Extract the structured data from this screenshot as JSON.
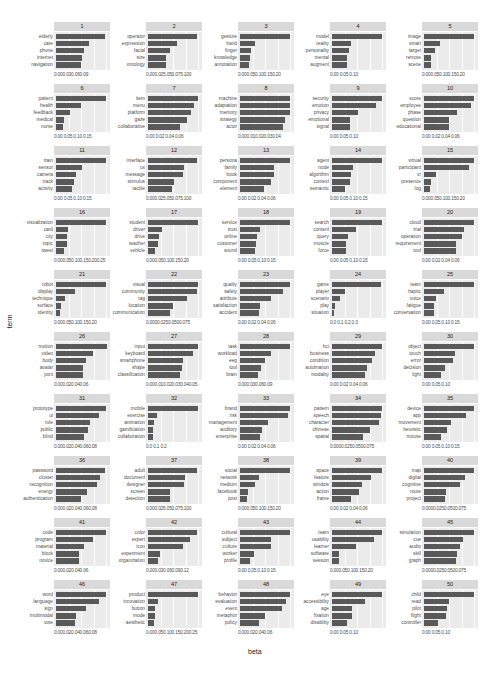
{
  "chart_data": {
    "type": "bar",
    "layout": "facet_wrap 10 rows x 5 cols, horizontal bars",
    "xlabel": "beta",
    "ylabel": "term",
    "grid": true,
    "facets": [
      {
        "topic": "1",
        "terms": [
          "elderly",
          "care",
          "phone",
          "internet",
          "navigation"
        ],
        "values": [
          0.09,
          0.06,
          0.052,
          0.048,
          0.045
        ],
        "ticks": "0.000.030.060.09",
        "xmax": 0.095
      },
      {
        "topic": "2",
        "terms": [
          "operator",
          "expression",
          "facial",
          "size",
          "ontology"
        ],
        "values": [
          0.098,
          0.058,
          0.045,
          0.037,
          0.036
        ],
        "ticks": "0.000.025.050.075.100",
        "xmax": 0.105
      },
      {
        "topic": "3",
        "terms": [
          "gesture",
          "hand",
          "finger",
          "knowledge",
          "annotation"
        ],
        "values": [
          0.2,
          0.06,
          0.045,
          0.042,
          0.035
        ],
        "ticks": "0.000.050.100.150.20",
        "xmax": 0.21
      },
      {
        "topic": "4",
        "terms": [
          "model",
          "reality",
          "personality",
          "mental",
          "augment"
        ],
        "values": [
          0.12,
          0.045,
          0.04,
          0.035,
          0.035
        ],
        "ticks": "0.00  0.05  0.10",
        "xmax": 0.125
      },
      {
        "topic": "5",
        "terms": [
          "image",
          "smart",
          "target",
          "remote",
          "scene"
        ],
        "values": [
          0.2,
          0.065,
          0.045,
          0.03,
          0.03
        ],
        "ticks": "0.000.050.100.150.20",
        "xmax": 0.21
      },
      {
        "topic": "6",
        "terms": [
          "patient",
          "health",
          "feedback",
          "medical",
          "nurse"
        ],
        "values": [
          0.16,
          0.08,
          0.045,
          0.025,
          0.022
        ],
        "ticks": "0.00 0.05 0.10 0.15",
        "xmax": 0.165
      },
      {
        "topic": "7",
        "terms": [
          "item",
          "menu",
          "platform",
          "gaze",
          "collaborative"
        ],
        "values": [
          0.063,
          0.058,
          0.055,
          0.05,
          0.04
        ],
        "ticks": "0.00 0.02 0.04 0.06",
        "xmax": 0.066
      },
      {
        "topic": "8",
        "terms": [
          "machine",
          "adaptation",
          "memory",
          "strategy",
          "actor"
        ],
        "values": [
          0.042,
          0.042,
          0.042,
          0.038,
          0.036
        ],
        "ticks": "0.000.010.020.030.04",
        "xmax": 0.044
      },
      {
        "topic": "9",
        "terms": [
          "security",
          "emotion",
          "privacy",
          "emotional",
          "signal"
        ],
        "values": [
          0.125,
          0.11,
          0.065,
          0.045,
          0.045
        ],
        "ticks": "0.00  0.05  0.10",
        "xmax": 0.13
      },
      {
        "topic": "10",
        "terms": [
          "score",
          "employee",
          "phase",
          "question",
          "educational"
        ],
        "values": [
          0.06,
          0.057,
          0.04,
          0.03,
          0.03
        ],
        "ticks": "0.00 0.02 0.04 0.06",
        "xmax": 0.063
      },
      {
        "topic": "11",
        "terms": [
          "train",
          "sensor",
          "camera",
          "track",
          "activity"
        ],
        "values": [
          0.155,
          0.08,
          0.062,
          0.055,
          0.05
        ],
        "ticks": "0.00 0.05 0.10 0.15",
        "xmax": 0.16
      },
      {
        "topic": "12",
        "terms": [
          "interface",
          "ux",
          "message",
          "stimulus",
          "tactile"
        ],
        "values": [
          0.098,
          0.072,
          0.07,
          0.052,
          0.048
        ],
        "ticks": "0.000.025.050.075.100",
        "xmax": 0.105
      },
      {
        "topic": "13",
        "terms": [
          "persona",
          "family",
          "book",
          "component",
          "element"
        ],
        "values": [
          0.065,
          0.045,
          0.044,
          0.04,
          0.032
        ],
        "ticks": "0.00 0.02 0.04 0.06",
        "xmax": 0.068
      },
      {
        "topic": "14",
        "terms": [
          "agent",
          "node",
          "algorithm",
          "context",
          "semantic"
        ],
        "values": [
          0.145,
          0.06,
          0.055,
          0.052,
          0.038
        ],
        "ticks": "0.00 0.05 0.10 0.15",
        "xmax": 0.15
      },
      {
        "topic": "15",
        "terms": [
          "virtual",
          "participant",
          "vr",
          "presence",
          "log"
        ],
        "values": [
          0.2,
          0.18,
          0.05,
          0.03,
          0.025
        ],
        "ticks": "0.000.050.100.150.20",
        "xmax": 0.21
      },
      {
        "topic": "16",
        "terms": [
          "visualization",
          "card",
          "city",
          "topic",
          "tweet"
        ],
        "values": [
          0.25,
          0.06,
          0.055,
          0.055,
          0.04
        ],
        "ticks": "0.000.050.100.150.200.25",
        "xmax": 0.26
      },
      {
        "topic": "17",
        "terms": [
          "student",
          "driver",
          "drive",
          "teacher",
          "vehicle"
        ],
        "values": [
          0.2,
          0.055,
          0.045,
          0.04,
          0.03
        ],
        "ticks": "0.000.050.100.150.20",
        "xmax": 0.21
      },
      {
        "topic": "18",
        "terms": [
          "service",
          "trust",
          "online",
          "customer",
          "sound"
        ],
        "values": [
          0.16,
          0.065,
          0.055,
          0.05,
          0.048
        ],
        "ticks": "0.00 0.05 0.10 0.15",
        "xmax": 0.165
      },
      {
        "topic": "19",
        "terms": [
          "search",
          "content",
          "query",
          "muscle",
          "force"
        ],
        "values": [
          0.145,
          0.07,
          0.045,
          0.04,
          0.04
        ],
        "ticks": "0.00 0.05 0.10 0.15",
        "xmax": 0.15
      },
      {
        "topic": "20",
        "terms": [
          "cloud",
          "trial",
          "operation",
          "requirement",
          "tool"
        ],
        "values": [
          0.062,
          0.05,
          0.048,
          0.04,
          0.04
        ],
        "ticks": "0.00 0.02 0.04 0.06",
        "xmax": 0.065
      },
      {
        "topic": "21",
        "terms": [
          "robot",
          "display",
          "technique",
          "surface",
          "identity"
        ],
        "values": [
          0.2,
          0.075,
          0.035,
          0.02,
          0.015
        ],
        "ticks": "0.000.050.100.150.20",
        "xmax": 0.21
      },
      {
        "topic": "22",
        "terms": [
          "visual",
          "community",
          "tag",
          "location",
          "communication"
        ],
        "values": [
          0.08,
          0.078,
          0.063,
          0.04,
          0.035
        ],
        "ticks": "0.0000.0250.0500.075",
        "xmax": 0.083
      },
      {
        "topic": "23",
        "terms": [
          "quality",
          "safety",
          "attribute",
          "satisfaction",
          "accident"
        ],
        "values": [
          0.06,
          0.052,
          0.037,
          0.024,
          0.023
        ],
        "ticks": "0.00 0.02 0.04 0.06",
        "xmax": 0.063
      },
      {
        "topic": "24",
        "terms": [
          "game",
          "player",
          "scenario",
          "play",
          "situation"
        ],
        "values": [
          0.35,
          0.09,
          0.055,
          0.02,
          0.015
        ],
        "ticks": "0.0  0.1  0.2  0.3",
        "xmax": 0.37
      },
      {
        "topic": "25",
        "terms": [
          "team",
          "haptic",
          "voice",
          "fatigue",
          "conversation"
        ],
        "values": [
          0.15,
          0.06,
          0.035,
          0.03,
          0.03
        ],
        "ticks": "0.00 0.05 0.10 0.15",
        "xmax": 0.155
      },
      {
        "topic": "26",
        "terms": [
          "motion",
          "video",
          "body",
          "avatar",
          "joint"
        ],
        "values": [
          0.068,
          0.05,
          0.04,
          0.037,
          0.036
        ],
        "ticks": "0.000.020.040.06",
        "xmax": 0.07
      },
      {
        "topic": "27",
        "terms": [
          "input",
          "keyboard",
          "smartphone",
          "shape",
          "classification"
        ],
        "values": [
          0.06,
          0.055,
          0.042,
          0.041,
          0.039
        ],
        "ticks": "0.000.010.020.030.040.05",
        "xmax": 0.063
      },
      {
        "topic": "28",
        "terms": [
          "task",
          "workload",
          "eeg",
          "tool",
          "brain"
        ],
        "values": [
          0.098,
          0.06,
          0.05,
          0.042,
          0.035
        ],
        "ticks": "0.000.030.060.09",
        "xmax": 0.102
      },
      {
        "topic": "29",
        "terms": [
          "hci",
          "business",
          "condition",
          "automation",
          "modality"
        ],
        "values": [
          0.06,
          0.052,
          0.049,
          0.043,
          0.04
        ],
        "ticks": "0.00 0.02 0.04 0.06",
        "xmax": 0.063
      },
      {
        "topic": "30",
        "terms": [
          "object",
          "touch",
          "error",
          "decision",
          "light"
        ],
        "values": [
          0.13,
          0.08,
          0.075,
          0.055,
          0.045
        ],
        "ticks": "0.00  0.05  0.10",
        "xmax": 0.135
      },
      {
        "topic": "31",
        "terms": [
          "prototype",
          "ui",
          "rule",
          "public",
          "blind"
        ],
        "values": [
          0.08,
          0.068,
          0.055,
          0.051,
          0.044
        ],
        "ticks": "0.000.020.040.060.08",
        "xmax": 0.083
      },
      {
        "topic": "32",
        "terms": [
          "mobile",
          "exercise",
          "animation",
          "gamification",
          "collaboration"
        ],
        "values": [
          0.27,
          0.05,
          0.03,
          0.028,
          0.025
        ],
        "ticks": "0.0  0.1  0.2",
        "xmax": 0.28
      },
      {
        "topic": "33",
        "terms": [
          "brand",
          "risk",
          "management",
          "auditory",
          "enterprise"
        ],
        "values": [
          0.08,
          0.076,
          0.045,
          0.035,
          0.032
        ],
        "ticks": "0.00 0.02 0.04 0.06",
        "xmax": 0.083
      },
      {
        "topic": "34",
        "terms": [
          "pattern",
          "speech",
          "character",
          "chinese",
          "spatial"
        ],
        "values": [
          0.08,
          0.078,
          0.075,
          0.06,
          0.05
        ],
        "ticks": "0.0000.0250.0500.075",
        "xmax": 0.083
      },
      {
        "topic": "35",
        "terms": [
          "device",
          "app",
          "movement",
          "heuristic",
          "mouse"
        ],
        "values": [
          0.15,
          0.125,
          0.08,
          0.07,
          0.05
        ],
        "ticks": "0.00 0.05 0.10 0.15",
        "xmax": 0.155
      },
      {
        "topic": "36",
        "terms": [
          "password",
          "cluster",
          "recognition",
          "energy",
          "authentication"
        ],
        "values": [
          0.078,
          0.07,
          0.065,
          0.05,
          0.04
        ],
        "ticks": "0.000.020.040.060.08",
        "xmax": 0.083
      },
      {
        "topic": "37",
        "terms": [
          "adult",
          "document",
          "designer",
          "screen",
          "detection"
        ],
        "values": [
          0.098,
          0.075,
          0.072,
          0.045,
          0.045
        ],
        "ticks": "0.000.025.050.075.100",
        "xmax": 0.105
      },
      {
        "topic": "38",
        "terms": [
          "social",
          "network",
          "medium",
          "facebook",
          "post"
        ],
        "values": [
          0.22,
          0.085,
          0.065,
          0.035,
          0.03
        ],
        "ticks": "0.000.050.100.150.20",
        "xmax": 0.23
      },
      {
        "topic": "39",
        "terms": [
          "space",
          "feature",
          "window",
          "action",
          "frame"
        ],
        "values": [
          0.067,
          0.052,
          0.04,
          0.036,
          0.025
        ],
        "ticks": "0.00 0.02 0.04 0.06",
        "xmax": 0.07
      },
      {
        "topic": "40",
        "terms": [
          "map",
          "digital",
          "cognitive",
          "route",
          "project"
        ],
        "values": [
          0.08,
          0.065,
          0.058,
          0.035,
          0.033
        ],
        "ticks": "0.0000.0250.0500.075",
        "xmax": 0.083
      },
      {
        "topic": "41",
        "terms": [
          "code",
          "program",
          "material",
          "block",
          "novice"
        ],
        "values": [
          0.065,
          0.048,
          0.037,
          0.03,
          0.03
        ],
        "ticks": "0.000.020.040.06",
        "xmax": 0.068
      },
      {
        "topic": "42",
        "terms": [
          "color",
          "expert",
          "icon",
          "experiment",
          "organization"
        ],
        "values": [
          0.118,
          0.1,
          0.085,
          0.028,
          0.024
        ],
        "ticks": "0.000.030.060.090.12",
        "xmax": 0.125
      },
      {
        "topic": "43",
        "terms": [
          "cultural",
          "subject",
          "culture",
          "worker",
          "profile"
        ],
        "values": [
          0.145,
          0.09,
          0.09,
          0.04,
          0.028
        ],
        "ticks": "0.00 0.05 0.10 0.15",
        "xmax": 0.15
      },
      {
        "topic": "44",
        "terms": [
          "learn",
          "usability",
          "learner",
          "software",
          "session"
        ],
        "values": [
          0.2,
          0.17,
          0.095,
          0.03,
          0.028
        ],
        "ticks": "0.000.050.100.150.20",
        "xmax": 0.21
      },
      {
        "topic": "45",
        "terms": [
          "simulation",
          "cue",
          "audio",
          "skill",
          "graph"
        ],
        "values": [
          0.08,
          0.062,
          0.058,
          0.052,
          0.051
        ],
        "ticks": "0.0000.0250.0500.075",
        "xmax": 0.083
      },
      {
        "topic": "46",
        "terms": [
          "word",
          "language",
          "sign",
          "multimodal",
          "vote"
        ],
        "values": [
          0.08,
          0.068,
          0.048,
          0.032,
          0.03
        ],
        "ticks": "0.000.020.040.060.08",
        "xmax": 0.083
      },
      {
        "topic": "47",
        "terms": [
          "product",
          "innovation",
          "button",
          "mode",
          "aesthetic"
        ],
        "values": [
          0.25,
          0.048,
          0.035,
          0.033,
          0.03
        ],
        "ticks": "0.000.050.100.150.200.25",
        "xmax": 0.26
      },
      {
        "topic": "48",
        "terms": [
          "behavior",
          "evaluation",
          "event",
          "metaphor",
          "policy"
        ],
        "values": [
          0.065,
          0.06,
          0.055,
          0.033,
          0.025
        ],
        "ticks": "0.000.020.040.06",
        "xmax": 0.068
      },
      {
        "topic": "49",
        "terms": [
          "eye",
          "accessibility",
          "age",
          "fixation",
          "disability"
        ],
        "values": [
          0.135,
          0.09,
          0.055,
          0.053,
          0.04
        ],
        "ticks": "0.00  0.05  0.10",
        "xmax": 0.14
      },
      {
        "topic": "50",
        "terms": [
          "child",
          "read",
          "pilot",
          "flight",
          "controller"
        ],
        "values": [
          0.125,
          0.062,
          0.058,
          0.055,
          0.035
        ],
        "ticks": "0.00  0.05  0.10",
        "xmax": 0.13
      }
    ]
  },
  "axes": {
    "xlabel": "beta",
    "ylabel": "term"
  }
}
